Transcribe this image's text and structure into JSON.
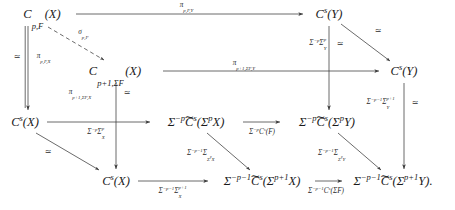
{
  "figure": {
    "kind": "commutative-diagram",
    "background_color": "#ffffff",
    "text_color": "#1a1a1a",
    "terminal_punctuation": "."
  },
  "nodes": {
    "back_top_left": {
      "label": "Cₚ,F(X)",
      "x": 42,
      "y": 14
    },
    "back_top_right": {
      "label": "Cˢ(Y)",
      "x": 329,
      "y": 14
    },
    "mid_top_left": {
      "label": "Cₚ₊₁,ΣF(X)",
      "x": 115,
      "y": 71
    },
    "mid_top_right": {
      "label": "Cˢ(Y)",
      "x": 404,
      "y": 71
    },
    "back_bot_left": {
      "label": "Cˢ(X)",
      "x": 25,
      "y": 122
    },
    "back_bot_mid": {
      "label": "Σ⁻ᵖ C̃ˢ(ΣᵖX)",
      "x": 196,
      "y": 122
    },
    "back_bot_right": {
      "label": "Σ⁻ᵖ C̃ˢ(ΣᵖY)",
      "x": 327,
      "y": 122
    },
    "front_bot_left": {
      "label": "Cˢ(X)",
      "x": 116,
      "y": 181
    },
    "front_bot_mid": {
      "label": "Σ⁻ᵖ⁻¹ C̃ˢ(Σᵖ⁺¹X)",
      "x": 262,
      "y": 181
    },
    "front_bot_right": {
      "label": "Σ⁻ᵖ⁻¹ C̃ˢ(Σᵖ⁺¹Y)",
      "x": 393,
      "y": 181
    }
  },
  "node_text": {
    "C_pF_X": "C",
    "C_p1SF_X": "C",
    "Cs_Y_back": "C",
    "Cs_Y_mid": "C",
    "Cs_X_back": "C",
    "Cs_X_front": "C",
    "Ctilde": "C",
    "tilde_glyph": "∼"
  },
  "edge_labels": {
    "pi_p_F_Y": "πₚ,F,Y",
    "pi_p1_SF_Y": "πₚ₊₁,ΣF,Y",
    "pi_p_F_X": "πₚ,F,X",
    "pi_p1_SF_X": "πₚ₊₁,ΣF,X",
    "sigma_p_F": "σₚ,F",
    "sigma_mp_sigma_p_X": "Σ⁻ᵖΣᵖ_X",
    "sigma_mp_sigma_p_Y": "Σ⁻ᵖΣᵖ_Y",
    "sigma_mp_Cs_F": "Σ⁻ᵖCˢ(F)",
    "sigma_mp1_sigma_p1_X": "Σ⁻ᵖ⁻¹Σᵖ⁺¹_X",
    "sigma_mp1_sigma_p1_Y": "Σ⁻ᵖ⁻¹Σᵖ⁺¹_Y",
    "sigma_mp1_Sigma_SpX": "Σ⁻ᵖ⁻¹Σ_{ΣᵖX}",
    "sigma_mp1_Sigma_SpY": "Σ⁻ᵖ⁻¹Σ_{ΣᵖY}",
    "sigma_mp1_Cs_SF": "Σ⁻ᵖ⁻¹Cˢ(ΣF)"
  },
  "iso_marks": {
    "left_outer": "≃",
    "left_pi_p_F_X": "≃",
    "mid_pi_p1_SF_X": "≃",
    "right_sigma_p_Y": "≃",
    "diag_top_right": "≃",
    "left_diag_bot": "≃",
    "right_sigma_p1_Y": "≃"
  },
  "symbols": {
    "Sigma": "Σ",
    "pi": "π",
    "sigma": "σ",
    "iso": "≃",
    "minus": "−"
  }
}
